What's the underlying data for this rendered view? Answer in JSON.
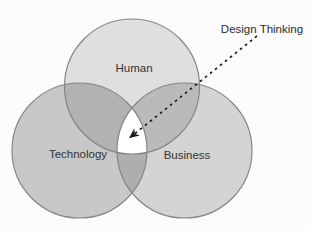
{
  "figure": {
    "type": "venn-diagram",
    "background": "#fcfcfc",
    "annotation": {
      "label": "Design Thinking"
    },
    "sets": [
      {
        "id": "human",
        "label": "Human",
        "fill": "#dfdfdf"
      },
      {
        "id": "technology",
        "label": "Technology",
        "fill": "#c8c8c8"
      },
      {
        "id": "business",
        "label": "Business",
        "fill": "#d4d4d4"
      }
    ],
    "overlaps": {
      "human_technology": "#b2b2b2",
      "human_business": "#bababa",
      "technology_business": "#aeaeae",
      "center": "#ffffff"
    },
    "colors": {
      "circle_stroke": "#858585",
      "arrow": "#1c1c1c",
      "text": "#333333"
    }
  }
}
